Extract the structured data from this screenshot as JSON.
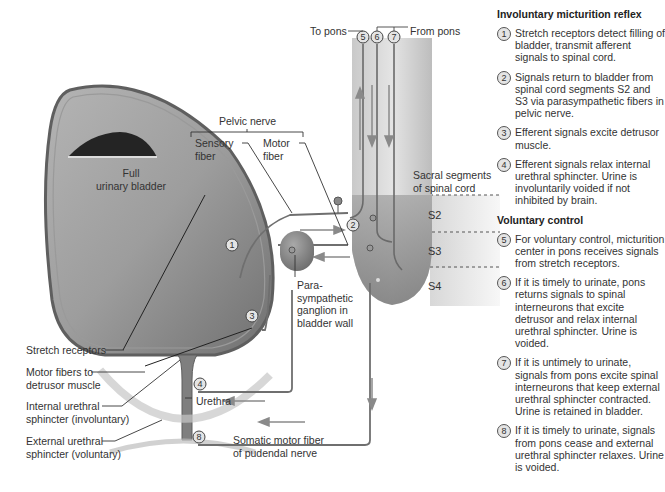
{
  "diagram": {
    "labels": {
      "to_pons": "To pons",
      "from_pons": "From pons",
      "pelvic_nerve": "Pelvic nerve",
      "sensory_fiber": [
        "Sensory",
        "fiber"
      ],
      "motor_fiber": [
        "Motor",
        "fiber"
      ],
      "full_bladder": [
        "Full",
        "urinary bladder"
      ],
      "sacral_segments": [
        "Sacral segments",
        "of spinal cord"
      ],
      "s2": "S2",
      "s3": "S3",
      "s4": "S4",
      "ganglion": [
        "Para-",
        "sympathetic",
        "ganglion in",
        "bladder wall"
      ],
      "stretch_receptors": "Stretch receptors",
      "motor_fibers_detrusor": [
        "Motor fibers to",
        "detrusor muscle"
      ],
      "internal_sphincter": [
        "Internal urethral",
        "sphincter (involuntary)"
      ],
      "external_sphincter": [
        "External urethral",
        "sphincter (voluntary)"
      ],
      "urethra": "Urethra",
      "somatic_fiber": [
        "Somatic motor fiber",
        "of pudendal nerve"
      ]
    },
    "markers": [
      "1",
      "2",
      "3",
      "4",
      "5",
      "6",
      "7",
      "8"
    ],
    "colors": {
      "bladder_fill": "#8e8e8e",
      "bladder_wall": "#6b6b6b",
      "urine_top": "#2b2b2b",
      "spinal_cord_top": "#d6d6d6",
      "spinal_cord_bottom": "#9a9a9a",
      "nerve": "#7a7a7a",
      "arrow": "#8a8a8a"
    }
  },
  "panel": {
    "involuntary_title": "Involuntary micturition reflex",
    "involuntary_steps": [
      {
        "num": "1",
        "text": "Stretch receptors detect filling of bladder, transmit afferent signals to spinal cord."
      },
      {
        "num": "2",
        "text": "Signals return to bladder from spinal cord segments S2 and S3 via parasympathetic fibers in pelvic nerve."
      },
      {
        "num": "3",
        "text": "Efferent signals excite detrusor muscle."
      },
      {
        "num": "4",
        "text": "Efferent signals relax internal urethral sphincter. Urine is involuntarily voided if not inhibited by brain."
      }
    ],
    "voluntary_title": "Voluntary control",
    "voluntary_steps": [
      {
        "num": "5",
        "text": "For voluntary control, micturition center in pons receives signals from stretch receptors."
      },
      {
        "num": "6",
        "text": "If it is timely to urinate, pons returns signals to spinal interneurons that excite detrusor and relax internal urethral sphincter. Urine is voided."
      },
      {
        "num": "7",
        "text": "If it is untimely to urinate, signals from pons excite spinal interneurons that keep external urethral sphincter contracted. Urine is retained in bladder."
      },
      {
        "num": "8",
        "text": "If it is timely to urinate, signals from pons cease and external urethral sphincter relaxes. Urine is voided."
      }
    ]
  }
}
